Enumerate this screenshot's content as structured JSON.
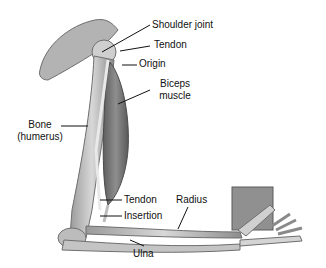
{
  "diagram": {
    "labels": {
      "shoulder_joint": "Shoulder joint",
      "tendon_top": "Tendon",
      "origin": "Origin",
      "biceps_line1": "Biceps",
      "biceps_line2": "muscle",
      "bone_line1": "Bone",
      "bone_line2": "(humerus)",
      "tendon_bottom": "Tendon",
      "insertion": "Insertion",
      "radius": "Radius",
      "ulna": "Ulna"
    },
    "colors": {
      "bone": "#c9c9c9",
      "bone_dark": "#8a8a8a",
      "muscle": "#7a7a7a",
      "weight_block": "#8f8f8f",
      "leader_line": "#111111"
    }
  }
}
